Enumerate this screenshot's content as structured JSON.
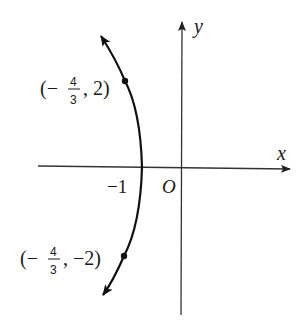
{
  "diagram": {
    "type": "coordinate-plane-curve",
    "axes": {
      "x_label": "x",
      "y_label": "y",
      "origin_label": "O"
    },
    "ticks": {
      "x_neg1_label": "−1"
    },
    "points": [
      {
        "name": "upper-point",
        "open": "(−",
        "num": "4",
        "den": "3",
        "rest": ", 2)",
        "coords": [
          -1.333,
          2
        ]
      },
      {
        "name": "lower-point",
        "open": "(−",
        "num": "4",
        "den": "3",
        "rest": ", −2)",
        "coords": [
          -1.333,
          -2
        ]
      }
    ],
    "vertex": [
      -1,
      0
    ],
    "colors": {
      "ink": "#1a1a1a",
      "axis": "#333333",
      "background": "#ffffff"
    }
  }
}
